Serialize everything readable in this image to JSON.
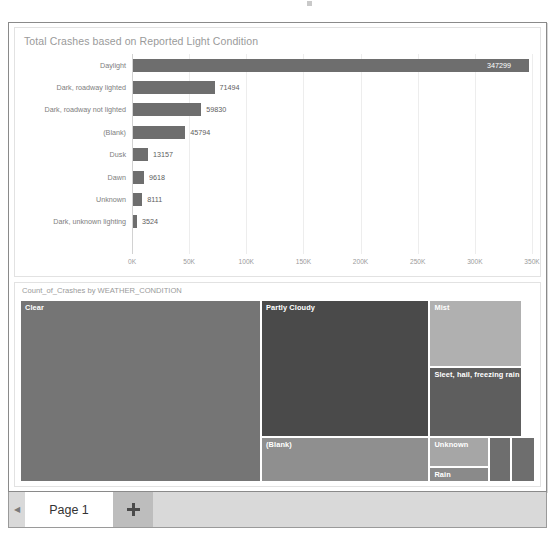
{
  "bar_visual": {
    "title": "Total Crashes based on Reported Light Condition"
  },
  "treemap_visual": {
    "title": "Count_of_Crashes by WEATHER_CONDITION"
  },
  "page_bar": {
    "prev_icon": "chevron-left-icon",
    "tab_label": "Page 1",
    "add_icon": "plus-icon"
  },
  "chart_data": [
    {
      "type": "bar",
      "title": "Total Crashes based on Reported Light Condition",
      "orientation": "horizontal",
      "xlabel": "",
      "ylabel": "",
      "xlim": [
        0,
        350000
      ],
      "grid": true,
      "legend": "none",
      "tick_labels": [
        "0K",
        "50K",
        "100K",
        "150K",
        "200K",
        "250K",
        "300K",
        "350K"
      ],
      "tick_values": [
        0,
        50000,
        100000,
        150000,
        200000,
        250000,
        300000,
        350000
      ],
      "bar_color": "#6e6e6e",
      "categories": [
        "Daylight",
        "Dark, roadway lighted",
        "Dark, roadway not lighted",
        "(Blank)",
        "Dusk",
        "Dawn",
        "Unknown",
        "Dark, unknown lighting"
      ],
      "values": [
        347299,
        71494,
        59830,
        45794,
        13157,
        9618,
        8111,
        3524
      ],
      "value_labels": [
        "347299",
        "71494",
        "59830",
        "45794",
        "13157",
        "9618",
        "8111",
        "3524"
      ]
    },
    {
      "type": "treemap",
      "title": "Count_of_Crashes by WEATHER_CONDITION",
      "tiles": [
        {
          "label": "Clear",
          "color": "#757575",
          "x": 0,
          "y": 0,
          "w": 46.8,
          "h": 100
        },
        {
          "label": "Partly Cloudy",
          "color": "#4a4a4a",
          "x": 46.8,
          "y": 0,
          "w": 32.7,
          "h": 75.5
        },
        {
          "label": "(Blank)",
          "color": "#8f8f8f",
          "x": 46.8,
          "y": 75.5,
          "w": 32.7,
          "h": 24.5
        },
        {
          "label": "Mist",
          "color": "#b0b0b0",
          "x": 79.5,
          "y": 0,
          "w": 18.0,
          "h": 37.0
        },
        {
          "label": "Sleet, hail, freezing rain",
          "color": "#5e5e5e",
          "x": 79.5,
          "y": 37.0,
          "w": 18.0,
          "h": 38.5
        },
        {
          "label": "Unknown",
          "color": "#a6a6a6",
          "x": 79.5,
          "y": 75.5,
          "w": 11.6,
          "h": 16.0
        },
        {
          "label": "Rain",
          "color": "#8a8a8a",
          "x": 79.5,
          "y": 91.5,
          "w": 11.6,
          "h": 8.5
        },
        {
          "label": "",
          "color": "#6e6e6e",
          "x": 91.1,
          "y": 75.5,
          "w": 4.3,
          "h": 24.5
        },
        {
          "label": "",
          "color": "#6e6e6e",
          "x": 95.4,
          "y": 75.5,
          "w": 4.6,
          "h": 24.5
        }
      ]
    }
  ]
}
